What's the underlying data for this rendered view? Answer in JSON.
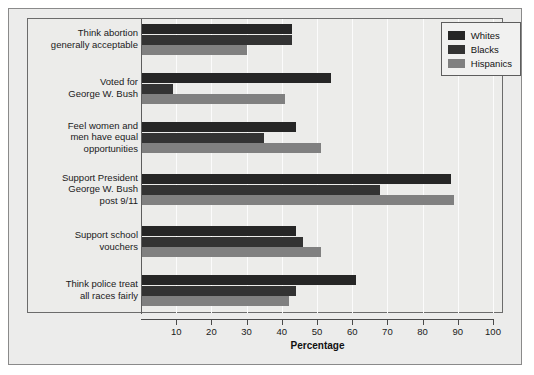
{
  "chart_data": {
    "type": "bar",
    "orientation": "horizontal",
    "title": "",
    "xlabel": "Percentage",
    "ylabel": "",
    "xlim": [
      0,
      100
    ],
    "xticks": [
      10,
      20,
      30,
      40,
      50,
      60,
      70,
      80,
      90,
      100
    ],
    "grid": true,
    "legend_position": "top-right",
    "categories": [
      "Think abortion generally acceptable",
      "Voted for George W. Bush",
      "Feel women and men have equal opportunities",
      "Support President George W. Bush post 9/11",
      "Support school vouchers",
      "Think police treat all races fairly"
    ],
    "category_lines": [
      [
        "Think abortion",
        "generally acceptable"
      ],
      [
        "Voted for",
        "George W. Bush"
      ],
      [
        "Feel women and",
        "men have equal",
        "opportunities"
      ],
      [
        "Support President",
        "George W. Bush",
        "post 9/11"
      ],
      [
        "Support school",
        "vouchers"
      ],
      [
        "Think police treat",
        "all races fairly"
      ]
    ],
    "series": [
      {
        "name": "Whites",
        "color": "#262626",
        "values": [
          43,
          54,
          44,
          88,
          44,
          61
        ]
      },
      {
        "name": "Blacks",
        "color": "#333333",
        "values": [
          43,
          9,
          35,
          68,
          46,
          44
        ]
      },
      {
        "name": "Hispanics",
        "color": "#808080",
        "values": [
          30,
          41,
          51,
          89,
          51,
          42
        ]
      }
    ]
  },
  "legend": {
    "entries": [
      "Whites",
      "Blacks",
      "Hispanics"
    ]
  },
  "axis": {
    "title": "Percentage",
    "tick_labels": [
      "10",
      "20",
      "30",
      "40",
      "50",
      "60",
      "70",
      "80",
      "90",
      "100"
    ]
  }
}
